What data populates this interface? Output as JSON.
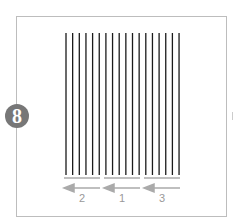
{
  "diagram": {
    "step_number": "8",
    "line_count": 18,
    "line_color": "#1a1a1a",
    "accent_color": "#aaaaaa",
    "groups": [
      {
        "label": "2",
        "order_label": "2",
        "direction": "left"
      },
      {
        "label": "1",
        "order_label": "1",
        "direction": "left"
      },
      {
        "label": "3",
        "order_label": "3",
        "direction": "left"
      }
    ]
  }
}
